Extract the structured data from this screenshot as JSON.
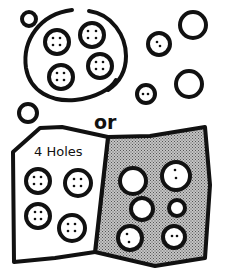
{
  "diagram": {
    "type": "hand-drawn sorting illustration",
    "colors": {
      "ink": "#111111",
      "background": "#ffffff",
      "shade": "#9a9a9a"
    },
    "top_section": {
      "description": "Loop enclosing 4-hole buttons, with loose buttons outside",
      "loop": {
        "enclosed_buttons": 4,
        "holes_each": 4
      },
      "loose_buttons": [
        {
          "holes": 0,
          "label": "small plain button, top-left"
        },
        {
          "holes": 0,
          "label": "large plain button, top-right"
        },
        {
          "holes": 2,
          "label": "button with 2 holes"
        },
        {
          "holes": 0,
          "label": "large plain button, right"
        },
        {
          "holes": 2,
          "label": "small button with 2 holes"
        },
        {
          "holes": 0,
          "label": "small plain button, left"
        }
      ]
    },
    "connector_text": "or",
    "bottom_section": {
      "description": "Sorting mat divided into two regions",
      "left_region": {
        "label": "4 Holes",
        "buttons": 4,
        "holes_each": 4
      },
      "right_region": {
        "label": "",
        "shaded": true,
        "buttons": [
          {
            "holes": 0
          },
          {
            "holes": 2
          },
          {
            "holes": 0
          },
          {
            "holes": 0
          },
          {
            "holes": 2
          },
          {
            "holes": 2
          }
        ]
      }
    }
  }
}
